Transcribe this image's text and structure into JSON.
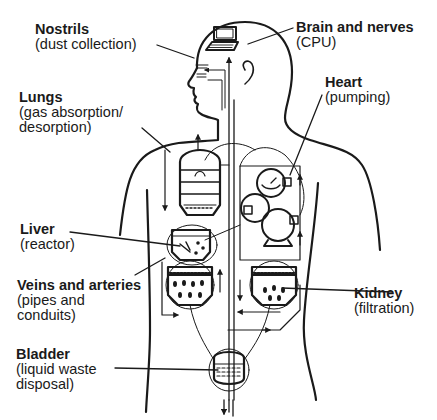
{
  "diagram": {
    "colors": {
      "ink": "#1a1a1a",
      "background": "#ffffff"
    },
    "labels": [
      {
        "id": "nostrils",
        "title": "Nostrils",
        "lines": [
          "(dust collection)"
        ]
      },
      {
        "id": "brain",
        "title": "Brain and nerves",
        "lines": [
          "(CPU)"
        ]
      },
      {
        "id": "lungs",
        "title": "Lungs",
        "lines": [
          "(gas absorption/",
          "desorption)"
        ]
      },
      {
        "id": "heart",
        "title": "Heart",
        "lines": [
          "(pumping)"
        ]
      },
      {
        "id": "liver",
        "title": "Liver",
        "lines": [
          "(reactor)"
        ]
      },
      {
        "id": "veins",
        "title": "Veins and arteries",
        "lines": [
          "(pipes and",
          "conduits)"
        ]
      },
      {
        "id": "kidney",
        "title": "Kidney",
        "lines": [
          "(filtration)"
        ]
      },
      {
        "id": "bladder",
        "title": "Bladder",
        "lines": [
          "(liquid waste",
          "disposal)"
        ]
      }
    ],
    "components": {
      "brain": "computer-terminal",
      "lungs": "absorption-column",
      "heart": "pumps",
      "liver": "reactor-vessel",
      "kidneys": "filter-tanks",
      "bladder": "collection-vessel"
    }
  }
}
